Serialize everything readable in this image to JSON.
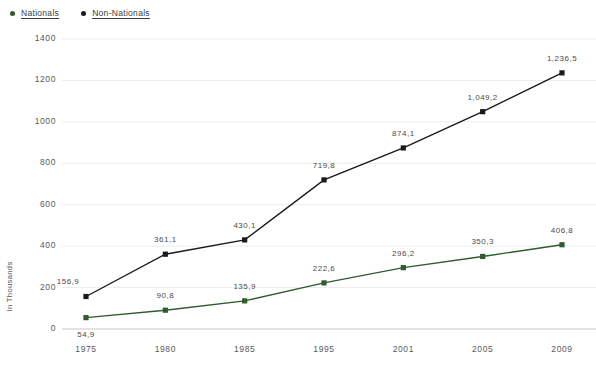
{
  "legend": {
    "position": "top-left",
    "items": [
      {
        "label": "Nationals",
        "color": "#2e5c2e",
        "marker": "legend-dot-icon"
      },
      {
        "label": "Non-Nationals",
        "color": "#1a1a1a",
        "marker": "legend-dot-icon"
      }
    ]
  },
  "axes": {
    "y_title": "In Thousands",
    "y_ticks": [
      "0",
      "200",
      "400",
      "600",
      "800",
      "1000",
      "1200",
      "1400"
    ],
    "x_ticks": [
      "1975",
      "1980",
      "1985",
      "1995",
      "2001",
      "2005",
      "2009"
    ]
  },
  "chart_data": {
    "type": "line",
    "title": "",
    "subtitle": "",
    "xlabel": "",
    "ylabel": "In Thousands",
    "categories": [
      "1975",
      "1980",
      "1985",
      "1995",
      "2001",
      "2005",
      "2009"
    ],
    "ylim": [
      0,
      1400
    ],
    "ytick_step": 200,
    "grid": true,
    "legend_position": "top-left",
    "series": [
      {
        "name": "Nationals",
        "color": "#2e5c2e",
        "values": [
          54.9,
          90.8,
          135.9,
          222.6,
          296.2,
          350.3,
          406.8
        ],
        "labels": [
          "54,9",
          "90,8",
          "135,9",
          "222,6",
          "296,2",
          "350,3",
          "406,8"
        ]
      },
      {
        "name": "Non-Nationals",
        "color": "#1a1a1a",
        "values": [
          156.9,
          361.1,
          430.1,
          719.8,
          874.1,
          1049.2,
          1236.5
        ],
        "labels": [
          "156,9",
          "361,1",
          "430,1",
          "719,8",
          "874,1",
          "1,049,2",
          "1,236,5"
        ]
      }
    ]
  }
}
